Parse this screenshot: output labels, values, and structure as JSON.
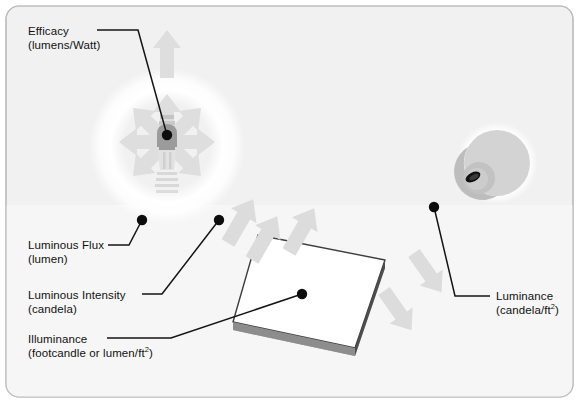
{
  "figure": {
    "background_color": "#f2f2f2",
    "background_color_lower": "#f7f7f7",
    "border_color": "#b9b9b9",
    "arrow_color": "#dcdcdc",
    "glow_color": "#ffffff",
    "leader_color": "#141414"
  },
  "labels": {
    "efficacy": {
      "term": "Efficacy",
      "unit": "(lumens/Watt)"
    },
    "luminous_flux": {
      "term": "Luminous Flux",
      "unit": "(lumen)"
    },
    "luminous_intensity": {
      "term": "Luminous Intensity",
      "unit": "(candela)"
    },
    "illuminance": {
      "term": "Illuminance",
      "unit_pre": "(footcandle or lumen/ft",
      "unit_sup": "2",
      "unit_post": ")"
    },
    "luminance": {
      "term": "Luminance",
      "unit_pre": "(candela/ft",
      "unit_sup": "2",
      "unit_post": ")"
    }
  },
  "objects": {
    "lamp": {
      "name": "light-bulb",
      "center_x": 167,
      "center_y": 142,
      "body_color": "#9e9e9e"
    },
    "surface": {
      "name": "illuminated-plane",
      "top_color": "#ffffff",
      "edge_color": "#4a4a4a",
      "side_color": "#a8a8a8"
    },
    "eye": {
      "name": "eye-sphere",
      "center_x": 497,
      "center_y": 163,
      "radius": 33,
      "sclera_color": "#d2d2d2",
      "iris_color": "#bdbdbd",
      "pupil_color": "#111111"
    }
  },
  "anchors": {
    "efficacy_dot": {
      "x": 167,
      "y": 135
    },
    "flux_dot": {
      "x": 142,
      "y": 220
    },
    "intensity_dot": {
      "x": 219,
      "y": 220
    },
    "illuminance_dot": {
      "x": 302,
      "y": 294
    },
    "luminance_dot": {
      "x": 434,
      "y": 207
    }
  }
}
